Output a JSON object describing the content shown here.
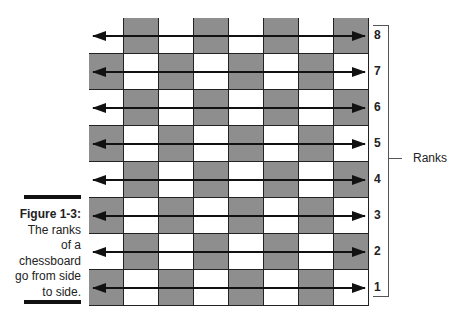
{
  "figure": {
    "number_label": "Figure 1-3:",
    "caption_lines": [
      "The ranks",
      "of a",
      "chessboard",
      "go from side",
      "to side."
    ]
  },
  "board": {
    "dark_color": "#8e8e8e",
    "light_color": "#ffffff",
    "files": 8,
    "ranks": [
      {
        "label": "8",
        "first_square": "light"
      },
      {
        "label": "7",
        "first_square": "dark"
      },
      {
        "label": "6",
        "first_square": "light"
      },
      {
        "label": "5",
        "first_square": "dark"
      },
      {
        "label": "4",
        "first_square": "light"
      },
      {
        "label": "3",
        "first_square": "dark"
      },
      {
        "label": "2",
        "first_square": "light"
      },
      {
        "label": "1",
        "first_square": "dark"
      }
    ]
  },
  "bracket": {
    "label": "Ranks"
  }
}
